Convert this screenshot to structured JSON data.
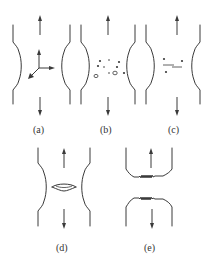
{
  "figure": {
    "panels": [
      {
        "id": "a",
        "label": "(a)",
        "content": "necking with triaxial stress state (3 arrows)"
      },
      {
        "id": "b",
        "label": "(b)",
        "content": "void nucleation at inclusions/particles"
      },
      {
        "id": "c",
        "label": "(c)",
        "content": "void growth and coalescence"
      },
      {
        "id": "d",
        "label": "(d)",
        "content": "central crack formation"
      },
      {
        "id": "e",
        "label": "(e)",
        "content": "cup-and-cone fracture, separation"
      }
    ],
    "colors": {
      "line": "#3a3a3a",
      "background": "#ffffff"
    }
  }
}
